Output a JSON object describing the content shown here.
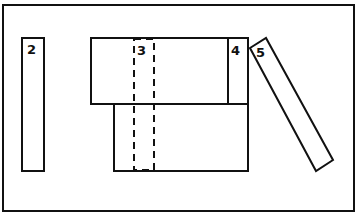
{
  "diagram": {
    "pieces": [
      {
        "id": "2",
        "label": "2",
        "style": "solid"
      },
      {
        "id": "3",
        "label": "3",
        "style": "dashed"
      },
      {
        "id": "4",
        "label": "4",
        "style": "solid"
      },
      {
        "id": "5",
        "label": "5",
        "style": "solid",
        "orientation": "tilted"
      }
    ],
    "unlabeled_pieces": [
      {
        "id": "upper-block",
        "style": "solid"
      },
      {
        "id": "lower-block",
        "style": "solid"
      }
    ]
  }
}
